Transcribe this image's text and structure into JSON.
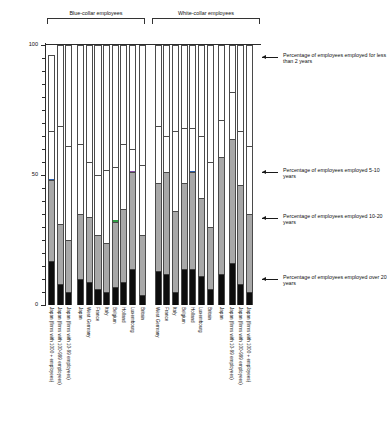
{
  "chart_data": {
    "type": "bar",
    "subtype": "stacked-bar",
    "title": "",
    "xlabel": "",
    "ylabel": "Percentage",
    "ylim": [
      0,
      100
    ],
    "yticks": [
      0,
      50,
      100
    ],
    "ytick_labels": [
      "0",
      "50",
      "100"
    ],
    "minor_tick_interval": 5,
    "grid": false,
    "legend_position": "right-annotations",
    "series": [
      {
        "name": "Percentage of employees employed over 20 years",
        "key": "over20",
        "color": "#0d0d0d"
      },
      {
        "name": "Percentage of employees employed 10-20 years",
        "key": "y10to20",
        "color": "#a8a8a8"
      },
      {
        "name": "Percentage of employees employed 5-10 years",
        "key": "y5to10",
        "color": "#ffffff"
      },
      {
        "name": "Percentage of employees employed for less than 2 years",
        "key": "lt2",
        "color": "#ffffff"
      }
    ],
    "groups": [
      {
        "label": "Blue-collar employees",
        "start": 0,
        "end": 9
      },
      {
        "label": "White-collar employees",
        "start": 10,
        "end": 19
      }
    ],
    "categories": [
      "Japan (firms with 1000 + employees)",
      "Japan (firms with 100-999 employees)",
      "Japan (firms with 10-99 employees)",
      "Japan",
      "West Germany",
      "France",
      "Italy",
      "Belgium",
      "Holland",
      "Luxembourg",
      "Britain",
      "West Germany",
      "France",
      "Italy",
      "Belgium",
      "Holland",
      "Luxembourg",
      "Britain",
      "Japan",
      "Japan (firms with 10-99 employees)",
      "Japan (firms with 100-999 employees)",
      "Japan (firms with 1000 + employees)"
    ],
    "bars": [
      {
        "category": "Japan (firms with 1000 + employees)",
        "group": "Blue-collar employees",
        "over20": 17,
        "y10to20": 31,
        "y5to10": 19,
        "lt2": 29,
        "accent": "#2b5fb0"
      },
      {
        "category": "Japan (firms with 100-999 employees)",
        "group": "Blue-collar employees",
        "over20": 8,
        "y10to20": 23,
        "y5to10": 38,
        "lt2": 31,
        "accent": ""
      },
      {
        "category": "Japan (firms with 10-99 employees)",
        "group": "Blue-collar employees",
        "over20": 5,
        "y10to20": 20,
        "y5to10": 36,
        "lt2": 39,
        "accent": ""
      },
      {
        "category": "Japan",
        "group": "Blue-collar employees",
        "over20": 10,
        "y10to20": 25,
        "y5to10": 27,
        "lt2": 38,
        "accent": ""
      },
      {
        "category": "West Germany",
        "group": "Blue-collar employees",
        "over20": 9,
        "y10to20": 25,
        "y5to10": 21,
        "lt2": 45,
        "accent": ""
      },
      {
        "category": "France",
        "group": "Blue-collar employees",
        "over20": 6,
        "y10to20": 21,
        "y5to10": 23,
        "lt2": 50,
        "accent": ""
      },
      {
        "category": "Italy",
        "group": "Blue-collar employees",
        "over20": 5,
        "y10to20": 19,
        "y5to10": 28,
        "lt2": 48,
        "accent": ""
      },
      {
        "category": "Belgium",
        "group": "Blue-collar employees",
        "over20": 7,
        "y10to20": 25,
        "y5to10": 21,
        "lt2": 47,
        "accent": "#2f9e44"
      },
      {
        "category": "Holland",
        "group": "Blue-collar employees",
        "over20": 9,
        "y10to20": 28,
        "y5to10": 25,
        "lt2": 38,
        "accent": ""
      },
      {
        "category": "Luxembourg",
        "group": "Blue-collar employees",
        "over20": 14,
        "y10to20": 37,
        "y5to10": 9,
        "lt2": 40,
        "accent": "#8a4fa8"
      },
      {
        "category": "Britain",
        "group": "Blue-collar employees",
        "over20": 4,
        "y10to20": 23,
        "y5to10": 27,
        "lt2": 46,
        "accent": ""
      },
      {
        "category": "West Germany",
        "group": "White-collar employees",
        "over20": 13,
        "y10to20": 34,
        "y5to10": 22,
        "lt2": 31,
        "accent": ""
      },
      {
        "category": "France",
        "group": "White-collar employees",
        "over20": 12,
        "y10to20": 39,
        "y5to10": 14,
        "lt2": 35,
        "accent": ""
      },
      {
        "category": "Italy",
        "group": "White-collar employees",
        "over20": 5,
        "y10to20": 31,
        "y5to10": 31,
        "lt2": 33,
        "accent": ""
      },
      {
        "category": "Belgium",
        "group": "White-collar employees",
        "over20": 14,
        "y10to20": 33,
        "y5to10": 21,
        "lt2": 32,
        "accent": ""
      },
      {
        "category": "Holland",
        "group": "White-collar employees",
        "over20": 14,
        "y10to20": 37,
        "y5to10": 17,
        "lt2": 32,
        "accent": "#2b5fb0"
      },
      {
        "category": "Luxembourg",
        "group": "White-collar employees",
        "over20": 11,
        "y10to20": 30,
        "y5to10": 24,
        "lt2": 35,
        "accent": ""
      },
      {
        "category": "Britain",
        "group": "White-collar employees",
        "over20": 6,
        "y10to20": 24,
        "y5to10": 25,
        "lt2": 45,
        "accent": ""
      },
      {
        "category": "Japan",
        "group": "White-collar employees",
        "over20": 12,
        "y10to20": 45,
        "y5to10": 14,
        "lt2": 29,
        "accent": ""
      },
      {
        "category": "Japan (firms with 10-99 employees)",
        "group": "White-collar employees",
        "over20": 16,
        "y10to20": 48,
        "y5to10": 18,
        "lt2": 18,
        "accent": ""
      },
      {
        "category": "Japan (firms with 100-999 employees)",
        "group": "White-collar employees",
        "over20": 8,
        "y10to20": 38,
        "y5to10": 21,
        "lt2": 33,
        "accent": ""
      },
      {
        "category": "Japan (firms with 1000 + employees)",
        "group": "White-collar employees",
        "over20": 5,
        "y10to20": 30,
        "y5to10": 26,
        "lt2": 39,
        "accent": ""
      }
    ],
    "annotations": [
      {
        "text": "Percentage of employees employed for less than 2 years",
        "y_value": 90
      },
      {
        "text": "Percentage of employees employed 5-10 years",
        "y_value": 50
      },
      {
        "text": "Percentage of employees employed 10-20 years",
        "y_value": 33
      },
      {
        "text": "Percentage of employees employed over 20 years",
        "y_value": 10
      }
    ]
  },
  "axis": {
    "ylabel": "Percentage",
    "tick_100": "100",
    "tick_50": "50",
    "tick_0": "0"
  },
  "groups": {
    "blue_collar": "Blue-collar employees",
    "white_collar": "White-collar employees"
  },
  "annotations": {
    "a1": "Percentage of employees employed for less than 2 years",
    "a2": "Percentage of employees employed 5-10 years",
    "a3": "Percentage of employees employed 10-20 years",
    "a4": "Percentage of employees employed over 20 years"
  }
}
